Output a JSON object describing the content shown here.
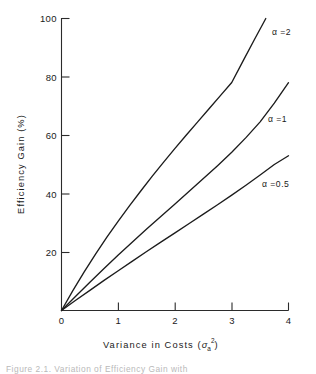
{
  "chart_data": {
    "type": "line",
    "title": "",
    "xlabel": "Variance in Costs (σ²ₐ)",
    "xlabel_parts": {
      "text": "Variance in Costs (",
      "symbol": "σ",
      "sub": "a",
      "sup": "2",
      "close": ")"
    },
    "ylabel": "Efficiency Gain (%)",
    "xlim": [
      0,
      4
    ],
    "ylim": [
      0,
      100
    ],
    "xticks": [
      0,
      1,
      2,
      3,
      4
    ],
    "xticklabels": [
      "0",
      "1",
      "2",
      "3",
      "4"
    ],
    "yticks": [
      0,
      20,
      40,
      60,
      80,
      100
    ],
    "yticklabels": [
      "0",
      "20",
      "40",
      "60",
      "80",
      "100"
    ],
    "grid": false,
    "legend_position": "inline-right-of-curves",
    "series": [
      {
        "name": "α = 2",
        "label": "α =2",
        "alpha": 2,
        "x": [
          0,
          0.2,
          0.4,
          0.6,
          0.8,
          1.0,
          1.2,
          1.4,
          1.6,
          1.8,
          2.0,
          2.2,
          2.4,
          2.6,
          2.8,
          3.0,
          3.2,
          3.4,
          3.6
        ],
        "values": [
          0,
          6.8,
          13.2,
          19.3,
          25.1,
          30.6,
          35.9,
          41.0,
          46.0,
          50.8,
          55.5,
          60.1,
          64.6,
          69.1,
          73.6,
          78.1,
          85.5,
          92.8,
          100.0
        ],
        "label_x": 3.68,
        "label_y": 93
      },
      {
        "name": "α = 1",
        "label": "α =1",
        "alpha": 1,
        "x": [
          0,
          0.25,
          0.5,
          0.75,
          1.0,
          1.25,
          1.5,
          1.75,
          2.0,
          2.25,
          2.5,
          2.75,
          3.0,
          3.25,
          3.5,
          3.75,
          4.0
        ],
        "values": [
          0,
          4.9,
          9.7,
          14.4,
          19.0,
          23.5,
          27.9,
          32.2,
          36.5,
          40.8,
          45.2,
          49.6,
          54.2,
          59.2,
          64.6,
          71.0,
          78.0
        ],
        "label_x": 3.62,
        "label_y": 62
      },
      {
        "name": "α = 0.5",
        "label": "α =0.5",
        "alpha": 0.5,
        "x": [
          0,
          0.25,
          0.5,
          0.75,
          1.0,
          1.25,
          1.5,
          1.75,
          2.0,
          2.25,
          2.5,
          2.75,
          3.0,
          3.25,
          3.5,
          3.75,
          4.0
        ],
        "values": [
          0,
          3.5,
          6.9,
          10.3,
          13.6,
          16.9,
          20.2,
          23.4,
          26.6,
          29.8,
          33.0,
          36.2,
          39.5,
          42.9,
          46.4,
          50.0,
          53.0
        ],
        "label_x": 3.55,
        "label_y": 43
      }
    ],
    "colors": {
      "axis": "#2b2b2b",
      "curve": "#1c1c1c",
      "background": "#ffffff",
      "caption": "#b9b9b9"
    }
  },
  "caption": {
    "text": "Figure 2.1.  Variation of Efficiency Gain with"
  }
}
